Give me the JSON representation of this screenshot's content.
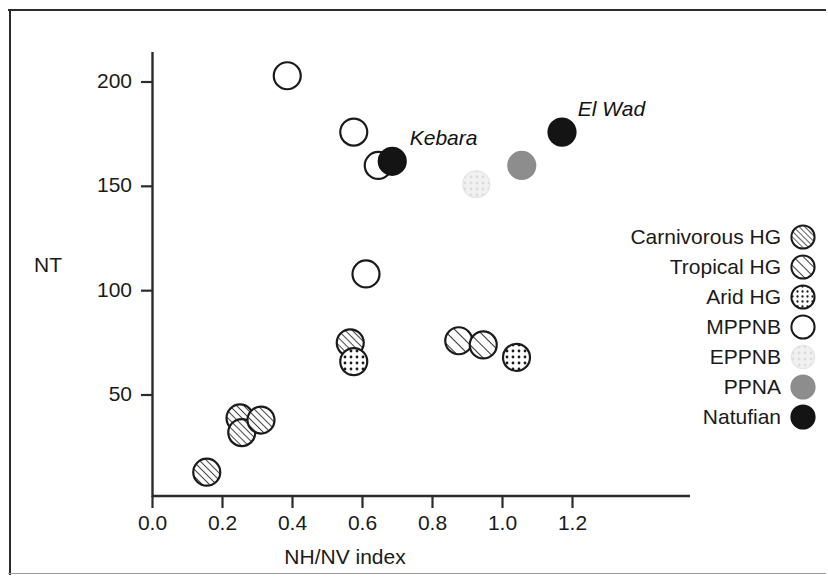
{
  "figure": {
    "type": "scatter-plot",
    "background_color": "#ffffff",
    "frame_color": "#2b2b2b"
  },
  "axes": {
    "y_title": "NT",
    "x_title": "NH/NV index",
    "y_ticks": [
      "50",
      "100",
      "150",
      "200"
    ],
    "x_ticks": [
      "0.0",
      "0.2",
      "0.4",
      "0.6",
      "0.8",
      "1.0",
      "1.2"
    ]
  },
  "legend": {
    "items": [
      {
        "label": "Carnivorous HG",
        "symbol": "circle-hatch-dense",
        "fill": "#ffffff",
        "stroke": "#1a1a1a"
      },
      {
        "label": "Tropical HG",
        "symbol": "circle-hatch-wide",
        "fill": "#ffffff",
        "stroke": "#1a1a1a"
      },
      {
        "label": "Arid HG",
        "symbol": "circle-dotted",
        "fill": "#ffffff",
        "stroke": "#1a1a1a"
      },
      {
        "label": "MPPNB",
        "symbol": "circle-open",
        "fill": "#ffffff",
        "stroke": "#1a1a1a"
      },
      {
        "label": "EPPNB",
        "symbol": "circle-dotted-light",
        "fill": "#ededed",
        "stroke": "#e2e2e2"
      },
      {
        "label": "PPNA",
        "symbol": "circle-filled-gray",
        "fill": "#8d8d8d",
        "stroke": "#8d8d8d"
      },
      {
        "label": "Natufian",
        "symbol": "circle-filled-black",
        "fill": "#141414",
        "stroke": "#141414"
      }
    ]
  },
  "annotations": [
    {
      "text": "Kebara",
      "x": 0.735,
      "y": 172
    },
    {
      "text": "El Wad",
      "x": 1.215,
      "y": 186
    }
  ],
  "chart_data": {
    "type": "scatter",
    "title": "",
    "xlabel": "NH/NV index",
    "ylabel": "NT",
    "xlim": [
      0.0,
      1.3
    ],
    "ylim": [
      0,
      215
    ],
    "xticks": [
      0.0,
      0.2,
      0.4,
      0.6,
      0.8,
      1.0,
      1.2
    ],
    "yticks": [
      50,
      100,
      150,
      200
    ],
    "grid": false,
    "legend_position": "right",
    "series": [
      {
        "name": "Carnivorous HG",
        "symbol": "circle-hatch-dense",
        "points": [
          {
            "x": 0.155,
            "y": 13
          },
          {
            "x": 0.25,
            "y": 39
          },
          {
            "x": 0.255,
            "y": 32
          },
          {
            "x": 0.31,
            "y": 38
          },
          {
            "x": 0.565,
            "y": 75
          }
        ]
      },
      {
        "name": "Tropical HG",
        "symbol": "circle-hatch-wide",
        "points": [
          {
            "x": 0.875,
            "y": 76
          },
          {
            "x": 0.945,
            "y": 74
          }
        ]
      },
      {
        "name": "Arid HG",
        "symbol": "circle-dotted",
        "points": [
          {
            "x": 0.575,
            "y": 66
          },
          {
            "x": 1.04,
            "y": 68
          }
        ]
      },
      {
        "name": "MPPNB",
        "symbol": "circle-open",
        "points": [
          {
            "x": 0.385,
            "y": 203
          },
          {
            "x": 0.575,
            "y": 176
          },
          {
            "x": 0.645,
            "y": 160
          },
          {
            "x": 0.61,
            "y": 108
          }
        ]
      },
      {
        "name": "EPPNB",
        "symbol": "circle-dotted-light",
        "points": [
          {
            "x": 0.925,
            "y": 151
          }
        ]
      },
      {
        "name": "PPNA",
        "symbol": "circle-filled-gray",
        "points": [
          {
            "x": 1.055,
            "y": 160
          }
        ]
      },
      {
        "name": "Natufian",
        "symbol": "circle-filled-black",
        "points": [
          {
            "x": 0.685,
            "y": 162
          },
          {
            "x": 1.17,
            "y": 176
          }
        ]
      }
    ]
  }
}
